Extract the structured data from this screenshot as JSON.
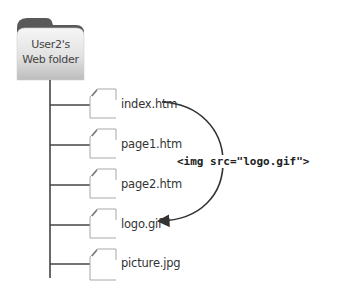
{
  "folder": {
    "label_line1": "User2's",
    "label_line2": "Web folder"
  },
  "files": [
    {
      "name": "index.htm"
    },
    {
      "name": "page1.htm"
    },
    {
      "name": "page2.htm"
    },
    {
      "name": "logo.gif"
    },
    {
      "name": "picture.jpg"
    }
  ],
  "reference": {
    "code": "<img src=\"logo.gif\">",
    "from": "index.htm",
    "to": "logo.gif"
  },
  "colors": {
    "folder_tab": "#5a5a5a",
    "folder_face_top": "#f4f4f4",
    "folder_face_bottom": "#c8c8c8",
    "line": "#444444",
    "file_outline": "#b0b0b0"
  }
}
